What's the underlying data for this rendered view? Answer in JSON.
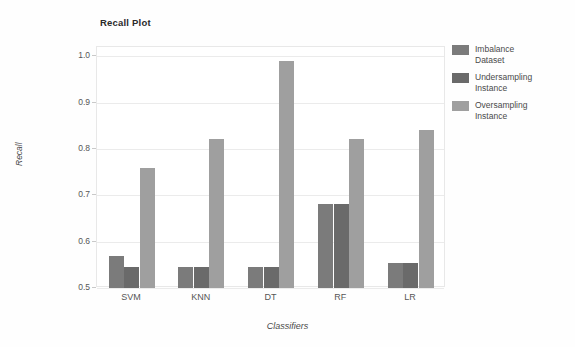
{
  "chart_data": {
    "type": "bar",
    "title": "Recall Plot",
    "xlabel": "Classifiers",
    "ylabel": "Recall",
    "categories": [
      "SVM",
      "KNN",
      "DT",
      "RF",
      "LR"
    ],
    "ylim": [
      0.5,
      1.02
    ],
    "yticks": [
      "1.0",
      "0.9",
      "0.8",
      "0.7",
      "0.6",
      "0.5"
    ],
    "ytick_values": [
      1.0,
      0.9,
      0.8,
      0.7,
      0.6,
      0.5
    ],
    "grid": true,
    "legend_position": "right",
    "series": [
      {
        "name": "Imbalance\nDataset",
        "color": "#7b7b7b",
        "values": [
          0.57,
          0.545,
          0.545,
          0.682,
          0.555
        ]
      },
      {
        "name": "Undersampling\nInstance",
        "color": "#6a6a6a",
        "values": [
          0.545,
          0.545,
          0.545,
          0.682,
          0.555
        ]
      },
      {
        "name": "Oversampling\nInstance",
        "color": "#9f9f9f",
        "values": [
          0.76,
          0.822,
          0.99,
          0.822,
          0.84
        ]
      }
    ]
  },
  "legend": {
    "items": [
      {
        "label": "Imbalance\nDataset",
        "color": "#7b7b7b"
      },
      {
        "label": "Undersampling\nInstance",
        "color": "#6a6a6a"
      },
      {
        "label": "Oversampling\nInstance",
        "color": "#9f9f9f"
      }
    ]
  }
}
